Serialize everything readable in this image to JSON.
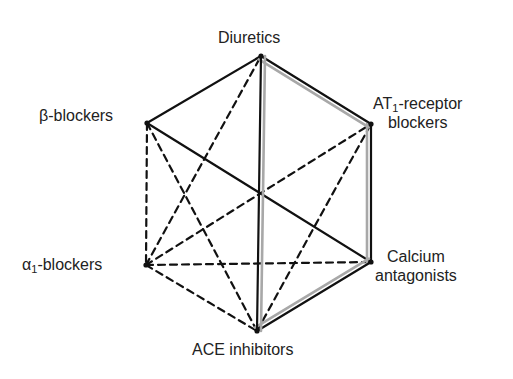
{
  "diagram": {
    "type": "hexagon-combination-diagram",
    "nodes": [
      {
        "id": "diuretics",
        "label": "Diuretics",
        "x": 261,
        "y": 56
      },
      {
        "id": "at1",
        "label_main": "AT",
        "label_sub": "1",
        "label_rest": "-receptor",
        "label_line2": "blockers",
        "x": 371,
        "y": 124
      },
      {
        "id": "calcium",
        "label_line1": "Calcium",
        "label_line2": "antagonists",
        "x": 371,
        "y": 262
      },
      {
        "id": "ace",
        "label": "ACE inhibitors",
        "x": 257,
        "y": 331
      },
      {
        "id": "alpha1",
        "label_main": "α",
        "label_sub": "1",
        "label_rest": "-blockers",
        "x": 146,
        "y": 265
      },
      {
        "id": "beta",
        "label": "β-blockers",
        "x": 147,
        "y": 123
      }
    ],
    "edges": [
      {
        "from": "diuretics",
        "to": "beta",
        "style": "solid"
      },
      {
        "from": "beta",
        "to": "calcium",
        "style": "solid"
      },
      {
        "from": "diuretics",
        "to": "at1",
        "style": "double"
      },
      {
        "from": "at1",
        "to": "calcium",
        "style": "double"
      },
      {
        "from": "calcium",
        "to": "ace",
        "style": "double"
      },
      {
        "from": "diuretics",
        "to": "ace",
        "style": "double"
      },
      {
        "from": "beta",
        "to": "alpha1",
        "style": "dashed"
      },
      {
        "from": "beta",
        "to": "ace",
        "style": "dashed"
      },
      {
        "from": "alpha1",
        "to": "diuretics",
        "style": "dashed"
      },
      {
        "from": "alpha1",
        "to": "at1",
        "style": "dashed"
      },
      {
        "from": "alpha1",
        "to": "calcium",
        "style": "dashed"
      },
      {
        "from": "alpha1",
        "to": "ace",
        "style": "dashed"
      },
      {
        "from": "ace",
        "to": "at1",
        "style": "dashed"
      }
    ],
    "colors": {
      "line": "#111111",
      "double_line_gray": "#a8a8a8",
      "text": "#222222"
    }
  }
}
